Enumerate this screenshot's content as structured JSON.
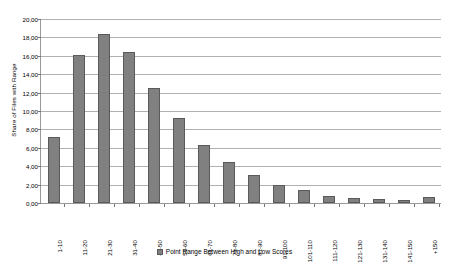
{
  "chart_data": {
    "type": "bar",
    "title": "",
    "xlabel": "",
    "ylabel": "Share of Files with Range",
    "ylim": [
      0,
      20
    ],
    "ytick_step": 2,
    "ytick_labels": [
      "20,00",
      "18,00",
      "16,00",
      "14,00",
      "12,00",
      "10,00",
      "8,00",
      "6,00",
      "4,00",
      "2,00",
      "0,00"
    ],
    "ytick_values": [
      20,
      18,
      16,
      14,
      12,
      10,
      8,
      6,
      4,
      2,
      0
    ],
    "grid": true,
    "legend_position": "bottom",
    "categories": [
      "1-10",
      "11-20",
      "21-30",
      "31-40",
      "41-50",
      "51-60",
      "61-70",
      "71-80",
      "81-90",
      "91-100",
      "101-110",
      "111-120",
      "121-130",
      "131-140",
      "141-150",
      "+150"
    ],
    "series": [
      {
        "name": "Point Range Between High and Low Scores",
        "color": "#808080",
        "values": [
          7.2,
          16.1,
          18.35,
          16.4,
          12.5,
          9.2,
          6.3,
          4.5,
          3.0,
          2.0,
          1.4,
          0.8,
          0.5,
          0.4,
          0.3,
          0.7
        ]
      }
    ]
  },
  "legend": {
    "label": "Point Range Between High and Low Scores"
  },
  "colors": {
    "bar_fill": "#808080",
    "bar_border": "#5a5a5a",
    "gridline": "#b0b0b0",
    "axis": "#999999"
  }
}
